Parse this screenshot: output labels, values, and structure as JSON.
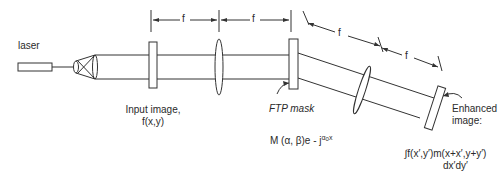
{
  "diagram": {
    "type": "optical-setup",
    "stroke_color": "#333333",
    "labels": {
      "laser": "laser",
      "input_image_line1": "Input image,",
      "input_image_line2": "f(x,y)",
      "ftp_mask": "FTP mask",
      "mask_function_prefix": "M (α, β)e - j",
      "mask_function_sup": "α",
      "mask_function_sub": "0",
      "mask_function_suffix": "x",
      "enhanced_line1": "Enhanced",
      "enhanced_line2": "image:",
      "output_formula_line1": "∫f(x′,y′)m(x+x′,y+y′)",
      "output_formula_line2": "dx′dy′"
    },
    "dimensions": [
      {
        "label": "f",
        "from": "input-image",
        "to": "lens-1"
      },
      {
        "label": "f",
        "from": "lens-1",
        "to": "ftp-mask"
      },
      {
        "label": "f",
        "from": "ftp-mask",
        "to": "lens-2"
      },
      {
        "label": "f",
        "from": "lens-2",
        "to": "output-plane"
      }
    ],
    "components": [
      "laser",
      "beam-expander",
      "input-image",
      "lens-1",
      "ftp-mask",
      "lens-2",
      "output-plane"
    ]
  }
}
